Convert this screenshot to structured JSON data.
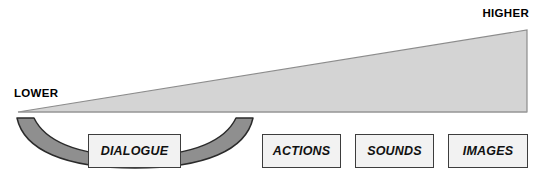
{
  "diagram": {
    "type": "production-cost-scale",
    "axis": {
      "low_label": "LOWER",
      "high_label": "HIGHER"
    },
    "wedge": {
      "name": "cost-gradient-wedge",
      "fill_color": "#d4d4d4",
      "stroke_color": "#8c8c8c",
      "direction": "increases-left-to-right"
    },
    "bracket": {
      "name": "dialogue-grouping-bracket",
      "fill_color": "#8f8f8f",
      "stroke_color": "#2b2b2b",
      "groups": "DIALOGUE"
    },
    "media_boxes": [
      {
        "id": "dialogue",
        "label": "DIALOGUE",
        "bracketed": true
      },
      {
        "id": "actions",
        "label": "ACTIONS",
        "bracketed": false
      },
      {
        "id": "sounds",
        "label": "SOUNDS",
        "bracketed": false
      },
      {
        "id": "images",
        "label": "IMAGES",
        "bracketed": false
      }
    ],
    "colors": {
      "box_fill": "#f2f2f2",
      "box_border": "#3d3d3d",
      "text": "#000000",
      "background": "#ffffff"
    }
  }
}
